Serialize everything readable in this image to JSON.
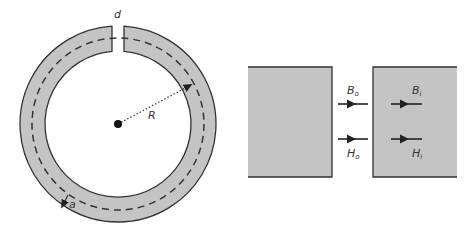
{
  "figure": {
    "left_panel": {
      "description": "Toroidal ring with gap",
      "labels": {
        "gap": "d",
        "radius": "R",
        "cross_section": "a"
      }
    },
    "right_panel": {
      "description": "Field across gap boundary",
      "labels": {
        "B_outside": "B",
        "B_outside_sub": "o",
        "B_inside": "B",
        "B_inside_sub": "i",
        "H_outside": "H",
        "H_outside_sub": "o",
        "H_inside": "H",
        "H_inside_sub": "i"
      }
    },
    "colors": {
      "fill": "#c4c4c4",
      "stroke": "#333333",
      "background": "#ffffff"
    }
  }
}
